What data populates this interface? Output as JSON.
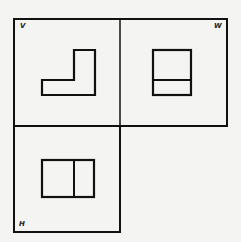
{
  "diagram": {
    "colors": {
      "line": "#111111",
      "background": "#f4f4f2"
    },
    "panels": [
      {
        "id": "V",
        "label": "V",
        "name": "front-view"
      },
      {
        "id": "W",
        "label": "W",
        "name": "side-view"
      },
      {
        "id": "H",
        "label": "H",
        "name": "top-view"
      }
    ]
  }
}
